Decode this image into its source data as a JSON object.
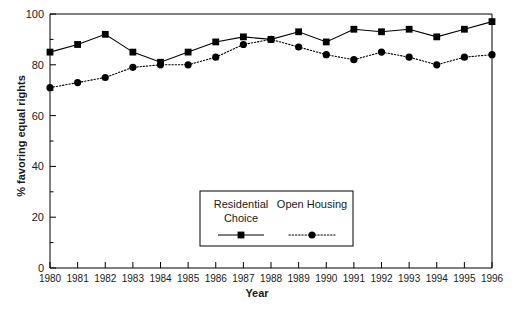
{
  "chart_data": {
    "type": "line",
    "title": "",
    "xlabel": "Year",
    "ylabel": "% favoring equal rights",
    "x": [
      1980,
      1981,
      1982,
      1983,
      1984,
      1985,
      1986,
      1987,
      1988,
      1989,
      1990,
      1991,
      1992,
      1993,
      1994,
      1995,
      1996
    ],
    "categories": [
      "1980",
      "1981",
      "1982",
      "1983",
      "1984",
      "1985",
      "1986",
      "1987",
      "1988",
      "1989",
      "1990",
      "1991",
      "1992",
      "1993",
      "1994",
      "1995",
      "1996"
    ],
    "series": [
      {
        "name": "Residential Choice",
        "marker": "square",
        "linestyle": "solid",
        "color": "#000000",
        "values": [
          85,
          88,
          92,
          85,
          81,
          85,
          89,
          91,
          90,
          93,
          89,
          94,
          93,
          94,
          91,
          94,
          97
        ]
      },
      {
        "name": "Open Housing",
        "marker": "circle",
        "linestyle": "dotted",
        "color": "#000000",
        "values": [
          71,
          73,
          75,
          79,
          80,
          80,
          83,
          88,
          90,
          87,
          84,
          82,
          85,
          83,
          80,
          83,
          84
        ]
      }
    ],
    "xlim": [
      1980,
      1996
    ],
    "ylim": [
      0,
      100
    ],
    "yticks": [
      0,
      20,
      40,
      60,
      80,
      100
    ],
    "ytick_labels": [
      "0",
      "20",
      "40",
      "60",
      "80",
      "100"
    ],
    "grid": false,
    "legend_position": "inside-lower-center"
  },
  "legend": {
    "entries": [
      {
        "label_line1": "Residential",
        "label_line2": "Choice",
        "marker": "square",
        "linestyle": "solid"
      },
      {
        "label_line1": "Open Housing",
        "label_line2": "",
        "marker": "circle",
        "linestyle": "dotted"
      }
    ]
  },
  "axes": {
    "x_title": "Year",
    "y_title": "% favoring equal rights"
  }
}
